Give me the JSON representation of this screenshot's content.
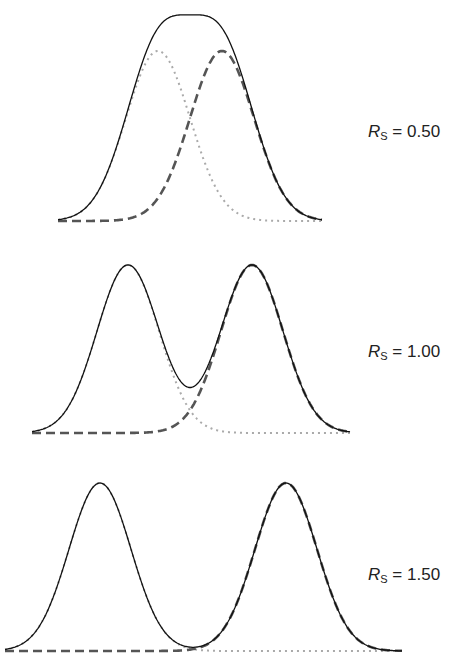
{
  "chart_data": {
    "type": "line",
    "panels": [
      {
        "label": "Rs = 0.50",
        "resolution": 0.5,
        "peak_separation_sigma": 2.0,
        "series": [
          {
            "name": "Peak 1",
            "style": "dotted",
            "color": "#aaaaaa",
            "center": -1.0,
            "sigma": 1.0
          },
          {
            "name": "Peak 2",
            "style": "dashed",
            "color": "#555555",
            "center": 1.0,
            "sigma": 1.0
          },
          {
            "name": "Sum",
            "style": "solid",
            "color": "#111111"
          }
        ]
      },
      {
        "label": "Rs = 1.00",
        "resolution": 1.0,
        "peak_separation_sigma": 4.0,
        "series": [
          {
            "name": "Peak 1",
            "style": "dotted",
            "color": "#aaaaaa",
            "center": -2.0,
            "sigma": 1.0
          },
          {
            "name": "Peak 2",
            "style": "dashed",
            "color": "#555555",
            "center": 2.0,
            "sigma": 1.0
          },
          {
            "name": "Sum",
            "style": "solid",
            "color": "#111111"
          }
        ]
      },
      {
        "label": "Rs = 1.50",
        "resolution": 1.5,
        "peak_separation_sigma": 6.0,
        "series": [
          {
            "name": "Peak 1",
            "style": "dotted",
            "color": "#aaaaaa",
            "center": -3.0,
            "sigma": 1.0
          },
          {
            "name": "Peak 2",
            "style": "dashed",
            "color": "#555555",
            "center": 3.0,
            "sigma": 1.0
          },
          {
            "name": "Sum",
            "style": "solid",
            "color": "#111111"
          }
        ]
      }
    ]
  },
  "labels": [
    {
      "symbol": "R",
      "subscript": "S",
      "text": " = 0.50"
    },
    {
      "symbol": "R",
      "subscript": "S",
      "text": " = 1.00"
    },
    {
      "symbol": "R",
      "subscript": "S",
      "text": " = 1.50"
    }
  ]
}
